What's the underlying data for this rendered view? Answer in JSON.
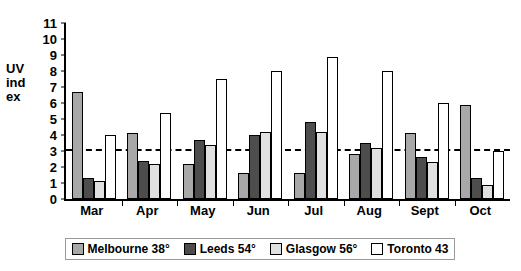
{
  "chart_data": {
    "type": "bar",
    "title": "",
    "xlabel": "",
    "ylabel": "UV index",
    "ylabel_lines": [
      "UV",
      "ind",
      "ex"
    ],
    "categories": [
      "Mar",
      "Apr",
      "May",
      "Jun",
      "Jul",
      "Aug",
      "Sept",
      "Oct"
    ],
    "ylim": [
      0,
      11
    ],
    "ytick_labels": [
      "0",
      "1",
      "2",
      "3",
      "4",
      "5",
      "6",
      "7",
      "8",
      "9",
      "10",
      "11"
    ],
    "ytick_values": [
      0,
      1,
      2,
      3,
      4,
      5,
      6,
      7,
      8,
      9,
      10,
      11
    ],
    "grid": false,
    "legend_position": "bottom",
    "annotations": [
      {
        "type": "horizontal-reference-line",
        "value": 3.1,
        "style": "dash-dot",
        "color": "#000000"
      }
    ],
    "series": [
      {
        "name": "Melbourne 38°",
        "color": "#a8a8a8",
        "values": [
          6.7,
          4.1,
          2.2,
          1.6,
          1.6,
          2.8,
          4.1,
          5.9
        ]
      },
      {
        "name": "Leeds 54°",
        "color": "#4d4d4d",
        "values": [
          1.3,
          2.4,
          3.7,
          4.0,
          4.8,
          3.5,
          2.6,
          1.3
        ]
      },
      {
        "name": "Glasgow 56°",
        "color": "#e0e0e0",
        "values": [
          1.1,
          2.2,
          3.4,
          4.2,
          4.2,
          3.2,
          2.3,
          0.9
        ]
      },
      {
        "name": "Toronto 43",
        "color": "#ffffff",
        "values": [
          4.0,
          5.4,
          7.5,
          8.0,
          8.9,
          8.0,
          6.0,
          3.0
        ]
      }
    ]
  },
  "legend": {
    "items": [
      {
        "label": "Melbourne 38°",
        "key": "melbourne"
      },
      {
        "label": "Leeds 54°",
        "key": "leeds"
      },
      {
        "label": "Glasgow 56°",
        "key": "glasgow"
      },
      {
        "label": "Toronto 43",
        "key": "toronto"
      }
    ]
  }
}
